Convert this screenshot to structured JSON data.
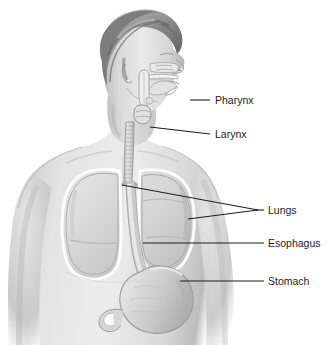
{
  "figure": {
    "style": "grayscale-medical-illustration",
    "background_color": "#ffffff",
    "width": 333,
    "height": 345
  },
  "palette": {
    "background": "#ffffff",
    "skin_light": "#e9e9e9",
    "skin_mid": "#d2d2d2",
    "skin_shadow": "#b4b4b4",
    "skin_deep_shadow": "#9a9a9a",
    "hair_light": "#b9b9b9",
    "hair_mid": "#8e8e8e",
    "hair_dark": "#6b6b6b",
    "organ_fill": "#dcdcdc",
    "organ_fill_dark": "#c4c4c4",
    "organ_outline": "#fbfbfb",
    "organ_line": "#9c9c9c",
    "leader_line": "#1d1d1d",
    "label_text": "#1d1d1d"
  },
  "labels": [
    {
      "id": "pharynx",
      "text": "Pharynx",
      "text_x": 215,
      "text_y": 104,
      "leader": [
        [
          190,
          100
        ],
        [
          210,
          100
        ]
      ],
      "target_organ": "pharynx"
    },
    {
      "id": "larynx",
      "text": "Larynx",
      "text_x": 215,
      "text_y": 138,
      "leader": [
        [
          150,
          127
        ],
        [
          210,
          134
        ]
      ],
      "target_organ": "larynx"
    },
    {
      "id": "lungs",
      "text": "Lungs",
      "text_x": 268,
      "text_y": 214,
      "leader": [
        [
          122,
          185
        ],
        [
          258,
          210
        ]
      ],
      "leader2": [
        [
          188,
          219
        ],
        [
          258,
          210
        ]
      ],
      "leader3": [
        [
          258,
          210
        ],
        [
          264,
          210
        ]
      ],
      "target_organ": "lungs"
    },
    {
      "id": "esophagus",
      "text": "Esophagus",
      "text_x": 268,
      "text_y": 247,
      "leader": [
        [
          143,
          243
        ],
        [
          264,
          243
        ]
      ],
      "target_organ": "esophagus"
    },
    {
      "id": "stomach",
      "text": "Stomach",
      "text_x": 268,
      "text_y": 285,
      "leader": [
        [
          180,
          281
        ],
        [
          264,
          281
        ]
      ],
      "target_organ": "stomach"
    }
  ],
  "organs": [
    {
      "id": "nasal-cavity",
      "name": "Nasal cavity"
    },
    {
      "id": "hard-palate",
      "name": "Hard palate"
    },
    {
      "id": "tongue",
      "name": "Tongue"
    },
    {
      "id": "pharynx",
      "name": "Pharynx"
    },
    {
      "id": "larynx",
      "name": "Larynx"
    },
    {
      "id": "trachea",
      "name": "Trachea"
    },
    {
      "id": "left-lung",
      "name": "Left lung"
    },
    {
      "id": "right-lung",
      "name": "Right lung"
    },
    {
      "id": "esophagus",
      "name": "Esophagus"
    },
    {
      "id": "stomach",
      "name": "Stomach"
    },
    {
      "id": "duodenum",
      "name": "Duodenum"
    }
  ],
  "body": {
    "head": "male head in right-facing profile with sagittal cutaway",
    "hair": "short swept dark grey hair",
    "torso": "upper torso with both shoulders and upper arms"
  }
}
